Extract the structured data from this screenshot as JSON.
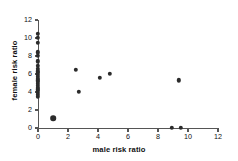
{
  "chart_data": {
    "type": "scatter",
    "title": "",
    "xlabel": "male risk ratio",
    "ylabel": "female risk ratio",
    "xlim": [
      0,
      12
    ],
    "ylim": [
      0,
      12
    ],
    "xticks": [
      0,
      2,
      4,
      6,
      8,
      10,
      12
    ],
    "yticks": [
      0,
      2,
      4,
      6,
      8,
      10,
      12
    ],
    "xtick_labels": [
      "0",
      "2",
      "4",
      "6",
      "8",
      "10",
      "12"
    ],
    "ytick_labels": [
      "0",
      "2",
      "4",
      "6",
      "8",
      "10",
      "12"
    ],
    "grid": false,
    "legend": null,
    "marker": "filled-circle",
    "marker_color": "#2b2b2b",
    "axis_color": "#555555",
    "points": [
      {
        "x": 0.0,
        "y": 10.5,
        "size": "normal"
      },
      {
        "x": 0.0,
        "y": 10.0,
        "size": "normal"
      },
      {
        "x": 0.0,
        "y": 9.5,
        "size": "normal"
      },
      {
        "x": 0.0,
        "y": 8.4,
        "size": "normal"
      },
      {
        "x": 0.0,
        "y": 8.0,
        "size": "normal"
      },
      {
        "x": 0.0,
        "y": 7.4,
        "size": "normal"
      },
      {
        "x": 0.0,
        "y": 6.9,
        "size": "normal"
      },
      {
        "x": 0.0,
        "y": 6.6,
        "size": "normal"
      },
      {
        "x": 0.0,
        "y": 6.3,
        "size": "normal"
      },
      {
        "x": 0.0,
        "y": 6.1,
        "size": "normal"
      },
      {
        "x": 0.0,
        "y": 5.9,
        "size": "normal"
      },
      {
        "x": 0.0,
        "y": 5.7,
        "size": "normal"
      },
      {
        "x": 0.0,
        "y": 5.5,
        "size": "normal"
      },
      {
        "x": 0.0,
        "y": 5.3,
        "size": "normal"
      },
      {
        "x": 0.0,
        "y": 5.1,
        "size": "normal"
      },
      {
        "x": 0.0,
        "y": 4.9,
        "size": "normal"
      },
      {
        "x": 0.0,
        "y": 4.7,
        "size": "normal"
      },
      {
        "x": 0.0,
        "y": 4.5,
        "size": "normal"
      },
      {
        "x": 0.0,
        "y": 4.3,
        "size": "normal"
      },
      {
        "x": 0.0,
        "y": 4.1,
        "size": "normal"
      },
      {
        "x": 0.0,
        "y": 3.9,
        "size": "normal"
      },
      {
        "x": 0.0,
        "y": 3.7,
        "size": "normal"
      },
      {
        "x": 0.0,
        "y": 3.5,
        "size": "normal"
      },
      {
        "x": 1.0,
        "y": 1.1,
        "size": "big"
      },
      {
        "x": 2.5,
        "y": 6.5,
        "size": "normal"
      },
      {
        "x": 2.7,
        "y": 4.0,
        "size": "normal"
      },
      {
        "x": 4.1,
        "y": 5.6,
        "size": "normal"
      },
      {
        "x": 4.8,
        "y": 6.0,
        "size": "normal"
      },
      {
        "x": 9.4,
        "y": 5.3,
        "size": "normal"
      },
      {
        "x": 8.9,
        "y": 0.0,
        "size": "normal"
      },
      {
        "x": 9.5,
        "y": 0.0,
        "size": "normal"
      }
    ]
  }
}
